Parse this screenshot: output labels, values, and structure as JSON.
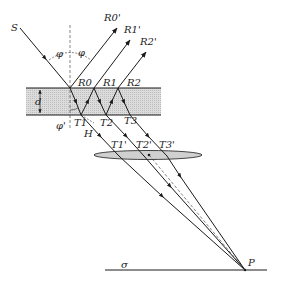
{
  "diagram": {
    "type": "thin-film interference ray diagram",
    "labels": {
      "source": "S",
      "reflected_points": [
        "R0",
        "R1",
        "R2"
      ],
      "reflected_rays": [
        "R0'",
        "R1'",
        "R2'"
      ],
      "transmitted_points": [
        "T1",
        "T2",
        "T3"
      ],
      "transmitted_rays": [
        "T1'",
        "T2'",
        "T3'"
      ],
      "thickness": "d",
      "incidence_angle": "φ",
      "refraction_angle": "φ'",
      "foot_point": "H",
      "focus_point": "P",
      "screen": "σ"
    },
    "colors": {
      "line": "#1a1a1a",
      "plate_fill": "#d4d4d4",
      "lens_fill": "#d0d0d0",
      "background": "#ffffff"
    }
  }
}
